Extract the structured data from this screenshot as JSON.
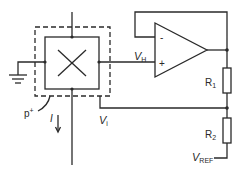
{
  "diagram": {
    "type": "circuit-schematic",
    "labels": {
      "v_hall": "V",
      "v_hall_sub": "H",
      "r1": "R",
      "r1_sub": "1",
      "r2": "R",
      "r2_sub": "2",
      "v_ref": "V",
      "v_ref_sub": "REF",
      "p_plus": "p",
      "p_plus_sup": "+",
      "current": "I",
      "v_i": "V",
      "v_i_sub": "i",
      "opamp_minus": "-",
      "opamp_plus": "+"
    },
    "colors": {
      "line": "#2a2a2a",
      "background": "#ffffff"
    }
  }
}
